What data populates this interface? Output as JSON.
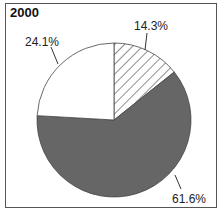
{
  "chart_data": {
    "type": "pie",
    "title": "2000",
    "categories": [
      "Hatched",
      "Dark gray",
      "White"
    ],
    "values": [
      14.3,
      61.6,
      24.1
    ],
    "labels": [
      "14.3%",
      "61.6%",
      "24.1%"
    ],
    "fills": [
      "hatched",
      "#666666",
      "#ffffff"
    ],
    "start_angle": "12 o'clock, clockwise",
    "legend": "none"
  }
}
